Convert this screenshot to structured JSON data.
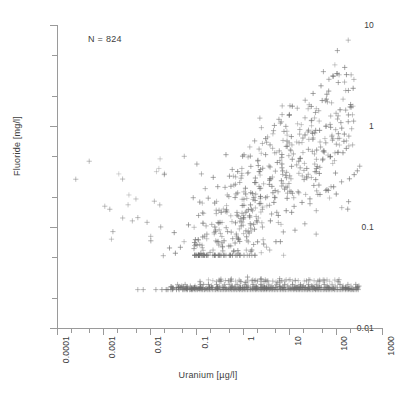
{
  "chart_data": {
    "type": "scatter",
    "title": "",
    "xlabel": "Uranium [µg/l]",
    "ylabel": "Fluoride [mg/l]",
    "xscale": "log",
    "yscale": "log",
    "xlim": [
      0.0001,
      1000
    ],
    "ylim": [
      0.01,
      10
    ],
    "grid": false,
    "legend": null,
    "annotations": [
      {
        "text": "N = 824",
        "x_px": 88,
        "y_px": 34
      }
    ],
    "n_points": 824,
    "marker": "plus",
    "marker_color": "#6e6e6e",
    "xticks": [
      0.0001,
      0.001,
      0.01,
      0.1,
      1,
      10,
      100,
      1000
    ],
    "xticklabels": [
      "0.0001",
      "0.001",
      "0.01",
      "0.1",
      "1",
      "10",
      "100",
      "1000"
    ],
    "yticks": [
      0.01,
      0.1,
      1,
      10
    ],
    "yticklabels": [
      "0.01",
      "0.1",
      "1",
      "10"
    ],
    "censored_value_y": 0.025,
    "points": [
      [
        0.0016,
        0.09
      ],
      [
        0.0042,
        0.115
      ],
      [
        0.0055,
        0.024
      ],
      [
        0.0072,
        0.024
      ],
      [
        0.0105,
        0.073
      ],
      [
        0.0125,
        0.18
      ],
      [
        0.0135,
        0.024
      ],
      [
        0.0182,
        0.024
      ],
      [
        0.0195,
        0.052
      ],
      [
        0.0205,
        0.33
      ],
      [
        0.0225,
        0.024
      ],
      [
        0.0245,
        0.024
      ],
      [
        0.0265,
        0.062
      ],
      [
        0.0285,
        0.024
      ],
      [
        0.031,
        0.024
      ],
      [
        0.0335,
        0.088
      ],
      [
        0.0355,
        0.055
      ],
      [
        0.0375,
        0.024
      ],
      [
        0.0395,
        0.027
      ],
      [
        0.0425,
        0.024
      ],
      [
        0.0455,
        0.063
      ],
      [
        0.0485,
        0.026
      ],
      [
        0.051,
        0.024
      ],
      [
        0.0545,
        0.024
      ],
      [
        0.0575,
        0.027
      ],
      [
        0.0605,
        0.024
      ],
      [
        0.0645,
        0.024
      ],
      [
        0.068,
        0.105
      ],
      [
        0.0715,
        0.024
      ],
      [
        0.0745,
        0.026
      ],
      [
        0.078,
        0.024
      ],
      [
        0.082,
        0.024
      ],
      [
        0.086,
        0.195
      ],
      [
        0.09,
        0.024
      ],
      [
        0.094,
        0.026
      ],
      [
        0.098,
        0.024
      ],
      [
        0.103,
        0.42
      ],
      [
        0.107,
        0.024
      ],
      [
        0.112,
        0.13
      ],
      [
        0.117,
        0.024
      ],
      [
        0.122,
        0.027
      ],
      [
        0.127,
        0.024
      ],
      [
        0.133,
        0.066
      ],
      [
        0.138,
        0.024
      ],
      [
        0.144,
        0.027
      ],
      [
        0.15,
        0.024
      ],
      [
        0.156,
        0.24
      ],
      [
        0.162,
        0.024
      ],
      [
        0.169,
        0.085
      ],
      [
        0.176,
        0.024
      ],
      [
        0.183,
        0.027
      ],
      [
        0.19,
        0.024
      ],
      [
        0.198,
        0.056
      ],
      [
        0.206,
        0.024
      ],
      [
        0.214,
        0.026
      ],
      [
        0.223,
        0.024
      ],
      [
        0.232,
        0.31
      ],
      [
        0.241,
        0.024
      ],
      [
        0.251,
        0.1
      ],
      [
        0.261,
        0.024
      ],
      [
        0.272,
        0.027
      ],
      [
        0.283,
        0.024
      ],
      [
        0.294,
        0.072
      ],
      [
        0.306,
        0.024
      ],
      [
        0.318,
        0.026
      ],
      [
        0.331,
        0.024
      ],
      [
        0.344,
        0.14
      ],
      [
        0.358,
        0.024
      ],
      [
        0.373,
        0.058
      ],
      [
        0.388,
        0.024
      ],
      [
        0.403,
        0.027
      ],
      [
        0.42,
        0.024
      ],
      [
        0.436,
        0.52
      ],
      [
        0.454,
        0.024
      ],
      [
        0.472,
        0.09
      ],
      [
        0.491,
        0.024
      ],
      [
        0.511,
        0.027
      ],
      [
        0.532,
        0.024
      ],
      [
        0.553,
        0.065
      ],
      [
        0.575,
        0.024
      ],
      [
        0.598,
        0.026
      ],
      [
        0.622,
        0.024
      ],
      [
        0.647,
        0.26
      ],
      [
        0.673,
        0.024
      ],
      [
        0.7,
        0.11
      ],
      [
        0.728,
        0.024
      ],
      [
        0.757,
        0.027
      ],
      [
        0.788,
        0.024
      ],
      [
        0.819,
        0.075
      ],
      [
        0.852,
        0.024
      ],
      [
        0.886,
        0.026
      ],
      [
        0.922,
        0.024
      ],
      [
        0.959,
        0.38
      ],
      [
        0.997,
        0.024
      ],
      [
        1.037,
        0.12
      ],
      [
        1.078,
        0.024
      ],
      [
        1.122,
        0.027
      ],
      [
        1.166,
        0.024
      ],
      [
        1.213,
        0.08
      ],
      [
        1.262,
        0.024
      ],
      [
        1.312,
        0.026
      ],
      [
        1.365,
        0.024
      ],
      [
        1.42,
        0.62
      ],
      [
        1.477,
        0.024
      ],
      [
        1.536,
        0.15
      ],
      [
        1.598,
        0.024
      ],
      [
        1.662,
        0.027
      ],
      [
        1.728,
        0.024
      ],
      [
        1.798,
        0.095
      ],
      [
        1.87,
        0.024
      ],
      [
        1.945,
        0.026
      ],
      [
        2.023,
        0.024
      ],
      [
        2.104,
        0.45
      ],
      [
        2.189,
        0.024
      ],
      [
        2.277,
        0.17
      ],
      [
        2.368,
        0.024
      ],
      [
        2.463,
        0.027
      ],
      [
        2.562,
        0.024
      ],
      [
        2.665,
        0.1
      ],
      [
        2.771,
        0.024
      ],
      [
        2.882,
        0.026
      ],
      [
        2.998,
        0.024
      ],
      [
        3.118,
        0.75
      ],
      [
        3.243,
        0.024
      ],
      [
        3.373,
        0.2
      ],
      [
        3.508,
        0.024
      ],
      [
        3.648,
        0.027
      ],
      [
        3.794,
        0.024
      ],
      [
        3.946,
        0.115
      ],
      [
        4.104,
        0.024
      ],
      [
        4.268,
        0.026
      ],
      [
        4.439,
        0.024
      ],
      [
        4.616,
        0.9
      ],
      [
        4.801,
        0.024
      ],
      [
        4.993,
        0.23
      ],
      [
        5.193,
        0.024
      ],
      [
        5.4,
        0.027
      ],
      [
        5.616,
        0.024
      ],
      [
        5.841,
        0.13
      ],
      [
        6.075,
        0.024
      ],
      [
        6.318,
        0.026
      ],
      [
        6.57,
        0.024
      ],
      [
        6.833,
        1.1
      ],
      [
        7.107,
        0.024
      ],
      [
        7.391,
        0.27
      ],
      [
        7.687,
        0.024
      ],
      [
        7.994,
        0.027
      ],
      [
        8.314,
        0.024
      ],
      [
        8.647,
        0.145
      ],
      [
        8.993,
        0.024
      ],
      [
        9.352,
        0.026
      ],
      [
        9.727,
        0.024
      ],
      [
        10.12,
        1.3
      ],
      [
        10.52,
        0.024
      ],
      [
        10.94,
        0.3
      ],
      [
        11.38,
        0.024
      ],
      [
        11.84,
        0.027
      ],
      [
        12.31,
        0.024
      ],
      [
        12.8,
        0.16
      ],
      [
        13.31,
        0.024
      ],
      [
        13.85,
        0.026
      ],
      [
        14.4,
        0.024
      ],
      [
        14.98,
        1.5
      ],
      [
        15.58,
        0.024
      ],
      [
        16.2,
        0.34
      ],
      [
        16.85,
        0.024
      ],
      [
        17.52,
        0.027
      ],
      [
        18.22,
        0.024
      ],
      [
        18.95,
        0.175
      ],
      [
        19.71,
        0.024
      ],
      [
        20.5,
        0.026
      ],
      [
        21.32,
        0.024
      ],
      [
        22.17,
        1.8
      ],
      [
        23.06,
        0.024
      ],
      [
        23.98,
        0.38
      ],
      [
        24.94,
        0.024
      ],
      [
        25.94,
        0.027
      ],
      [
        26.98,
        0.024
      ],
      [
        28.05,
        0.19
      ],
      [
        29.18,
        0.024
      ],
      [
        30.34,
        0.026
      ],
      [
        31.56,
        0.024
      ],
      [
        32.82,
        2.1
      ],
      [
        34.13,
        0.024
      ],
      [
        35.5,
        0.42
      ],
      [
        36.92,
        0.024
      ],
      [
        38.39,
        0.027
      ],
      [
        39.93,
        0.024
      ],
      [
        41.53,
        0.21
      ],
      [
        43.19,
        0.024
      ],
      [
        44.92,
        0.026
      ],
      [
        46.71,
        0.024
      ],
      [
        48.58,
        2.5
      ],
      [
        50.52,
        0.024
      ],
      [
        52.54,
        0.46
      ],
      [
        54.65,
        0.024
      ],
      [
        56.83,
        0.027
      ],
      [
        59.1,
        0.024
      ],
      [
        61.47,
        0.23
      ],
      [
        63.93,
        0.024
      ],
      [
        66.48,
        0.026
      ],
      [
        69.14,
        0.024
      ],
      [
        71.91,
        2.9
      ],
      [
        74.79,
        0.024
      ],
      [
        77.78,
        0.5
      ],
      [
        80.89,
        0.024
      ],
      [
        84.13,
        0.027
      ],
      [
        87.49,
        0.024
      ],
      [
        91,
        0.25
      ],
      [
        94.64,
        0.024
      ],
      [
        98.42,
        0.026
      ],
      [
        102.4,
        0.024
      ],
      [
        106.4,
        3.3
      ],
      [
        110.7,
        0.024
      ],
      [
        115.1,
        0.55
      ],
      [
        119.7,
        0.024
      ],
      [
        124.5,
        0.027
      ],
      [
        129.5,
        0.024
      ],
      [
        134.6,
        0.28
      ],
      [
        140,
        0.024
      ],
      [
        145.6,
        0.026
      ],
      [
        151.4,
        0.024
      ],
      [
        157.4,
        3.8
      ],
      [
        163.7,
        0.024
      ],
      [
        170.2,
        0.6
      ],
      [
        177,
        0.024
      ],
      [
        184.1,
        0.027
      ],
      [
        191.4,
        0.024
      ],
      [
        199.1,
        0.3
      ],
      [
        207,
        0.024
      ],
      [
        215.3,
        0.026
      ],
      [
        223.9,
        0.024
      ],
      [
        232.9,
        0.65
      ],
      [
        242.2,
        0.024
      ],
      [
        251.9,
        0.33
      ],
      [
        261.9,
        0.024
      ],
      [
        272.4,
        0.027
      ],
      [
        283.3,
        0.024
      ],
      [
        294.6,
        0.36
      ],
      [
        306.4,
        0.024
      ],
      [
        318.6,
        0.026
      ],
      [
        331.4,
        0.4
      ]
    ]
  }
}
